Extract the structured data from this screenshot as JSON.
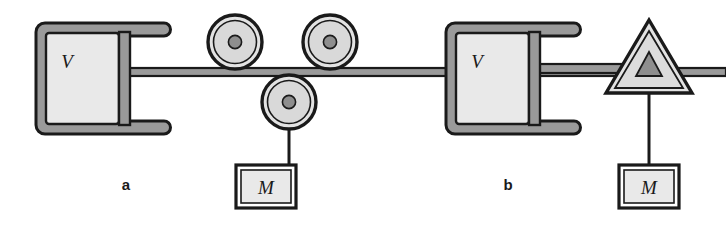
{
  "figure": {
    "background_color": "#ffffff",
    "line_color": "#1a1a1a",
    "frame_fill": "#9a9a9a",
    "body_fill": "#e6e6e6",
    "hub_fill": "#8e8e8e",
    "panels": [
      {
        "id": "a",
        "label": "a",
        "cart_label": "V",
        "weight_label": "M",
        "mechanism": "three-pulley-system",
        "pulley_count": 3,
        "pulleys": [
          {
            "name": "upper-left-pulley",
            "cx": 235,
            "cy": 42,
            "r": 27
          },
          {
            "name": "upper-right-pulley",
            "cx": 330,
            "cy": 42,
            "r": 27
          },
          {
            "name": "lower-pulley",
            "cx": 289,
            "cy": 102,
            "r": 27
          }
        ]
      },
      {
        "id": "b",
        "label": "b",
        "cart_label": "V",
        "weight_label": "M",
        "mechanism": "single-triangular-pulley",
        "pulley_count": 1,
        "pulleys": [
          {
            "name": "triangle-pulley",
            "cx": 649,
            "cy": 62,
            "r": 40
          }
        ]
      }
    ]
  }
}
